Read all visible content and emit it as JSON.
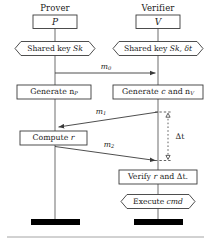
{
  "figure": {
    "type": "sequence-diagram",
    "columns": [
      {
        "id": "prover",
        "role_title": "Prover",
        "actor_symbol": "P"
      },
      {
        "id": "verifier",
        "role_title": "Verifier",
        "actor_symbol": "V"
      }
    ],
    "prover": {
      "role_title": "Prover",
      "actor_symbol": "P",
      "shared_key": "Shared key Sk",
      "shared_key_main": "Shared key ",
      "shared_key_var": "Sk",
      "generate": "Generate n",
      "generate_sub": "P",
      "compute": "Compute ",
      "compute_var": "r"
    },
    "verifier": {
      "role_title": "Verifier",
      "actor_symbol": "V",
      "shared_key_main": "Shared key ",
      "shared_key_var": "Sk",
      "shared_key_tail": ", δt",
      "generate_pre": "Generate ",
      "generate_c": "c",
      "generate_mid": " and n",
      "generate_sub": "V",
      "verify_pre": "Verify ",
      "verify_r": "r",
      "verify_mid": " and Δt.",
      "execute_pre": "Execute ",
      "execute_cmd": "cmd"
    },
    "messages": [
      {
        "id": "m0",
        "label": "m",
        "sub": "0",
        "from": "prover",
        "to": "verifier",
        "direction": "right"
      },
      {
        "id": "m1",
        "label": "m",
        "sub": "1",
        "from": "verifier",
        "to": "prover",
        "direction": "left"
      },
      {
        "id": "m2",
        "label": "m",
        "sub": "2",
        "from": "prover",
        "to": "verifier",
        "direction": "right"
      }
    ],
    "timing": {
      "label": "Δt",
      "style": "dashed-vertical-measure",
      "top_marker": "triangle-up",
      "bottom_marker": "triangle-down"
    },
    "colors": {
      "stroke": "#3a3a3a",
      "text": "#1a1a1a",
      "lifeline": "#6e6e6e",
      "terminator": "#000000",
      "rule": "#9a9a9a",
      "background": "#ffffff"
    }
  }
}
